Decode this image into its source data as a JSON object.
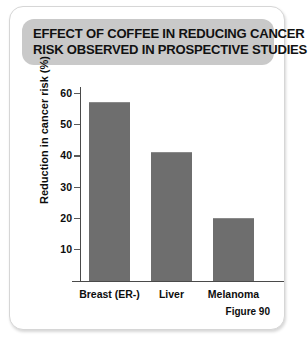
{
  "card": {
    "figure_caption": "Figure 90"
  },
  "title": {
    "line1": "EFFECT OF COFFEE IN REDUCING CANCER",
    "line2": "RISK OBSERVED IN PROSPECTIVE STUDIES"
  },
  "colors": {
    "bar": "#6e6e6e",
    "banner": "#c9c9c9",
    "axis": "#4a4a4a",
    "card_border": "#d6d6d6",
    "text": "#0d0d0d"
  },
  "chart_data": {
    "type": "bar",
    "title": "EFFECT OF COFFEE IN REDUCING CANCER RISK OBSERVED IN PROSPECTIVE STUDIES",
    "categories": [
      "Breast (ER-)",
      "Liver",
      "Melanoma"
    ],
    "values": [
      57,
      41,
      20
    ],
    "xlabel": "",
    "ylabel": "Reduction in cancer risk (%)",
    "ylim": [
      0,
      62
    ],
    "yticks": [
      10,
      20,
      30,
      40,
      50,
      60
    ],
    "ytick_labels": [
      "10",
      "20",
      "30",
      "40",
      "50",
      "60"
    ],
    "grid": false,
    "legend": "none",
    "caption": "Figure 90"
  }
}
